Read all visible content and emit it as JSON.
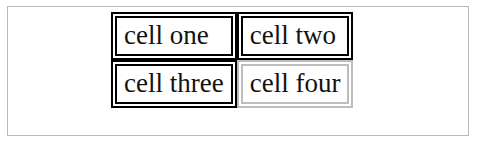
{
  "page": {
    "background_color": "#ffffff",
    "border_color": "#b9b9b9"
  },
  "table": {
    "name": "two-by-two-cell-table",
    "border_style": "double",
    "default_border_color": "#000000",
    "light_border_color": "#bdbdbd",
    "rows": [
      {
        "cells": [
          {
            "text": "cell one",
            "border_color": "#000000",
            "border_variant": "dark"
          },
          {
            "text": "cell two",
            "border_color": "#000000",
            "border_variant": "dark"
          }
        ]
      },
      {
        "cells": [
          {
            "text": "cell three",
            "border_color": "#000000",
            "border_variant": "dark"
          },
          {
            "text": "cell four",
            "border_color": "#bdbdbd",
            "border_variant": "light"
          }
        ]
      }
    ]
  }
}
